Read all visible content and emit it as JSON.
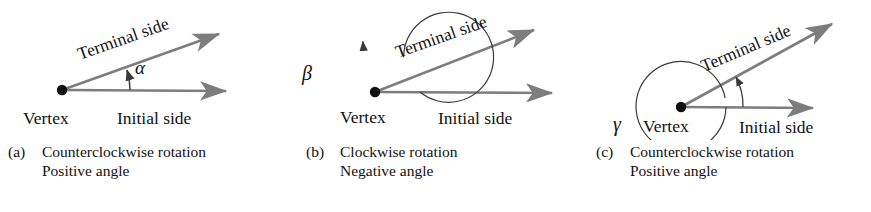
{
  "figure": {
    "stroke_color": "#7d7d7d",
    "arc_color": "#3a3a3a",
    "text_color": "#111111",
    "background": "#ffffff"
  },
  "labels": {
    "terminal_side": "Terminal side",
    "initial_side": "Initial side",
    "vertex": "Vertex"
  },
  "panels": [
    {
      "id": "a",
      "tag": "(a)",
      "greek": "α",
      "greek_name": "alpha",
      "caption_line1": "Counterclockwise rotation",
      "caption_line2": "Positive angle",
      "rotation": "counterclockwise",
      "angle_sign": "positive",
      "has_circle": false,
      "arc_sweep_degrees": 22,
      "terminal_side": "Terminal side",
      "initial_side": "Initial side",
      "vertex": "Vertex"
    },
    {
      "id": "b",
      "tag": "(b)",
      "greek": "β",
      "greek_name": "beta",
      "caption_line1": "Clockwise rotation",
      "caption_line2": "Negative angle",
      "rotation": "clockwise",
      "angle_sign": "negative",
      "has_circle": true,
      "arc_sweep_degrees": -338,
      "terminal_side": "Terminal side",
      "initial_side": "Initial side",
      "vertex": "Vertex"
    },
    {
      "id": "c",
      "tag": "(c)",
      "greek": "γ",
      "greek_name": "gamma",
      "caption_line1": "Counterclockwise rotation",
      "caption_line2": "Positive angle",
      "rotation": "counterclockwise",
      "angle_sign": "positive",
      "has_circle": true,
      "arc_sweep_degrees": 382,
      "terminal_side": "Terminal side",
      "initial_side": "Initial side",
      "vertex": "Vertex"
    }
  ]
}
